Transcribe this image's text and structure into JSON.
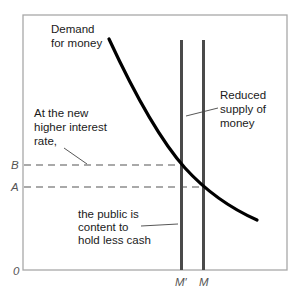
{
  "diagram": {
    "type": "money-market-supply-demand",
    "labels": {
      "demand": [
        "Demand",
        "for money"
      ],
      "higher_rate": [
        "At the new",
        "higher interest",
        "rate,"
      ],
      "reduced_supply": [
        "Reduced",
        "supply of",
        "money"
      ],
      "public": [
        "the public is",
        "content to",
        "hold less cash"
      ]
    },
    "axis": {
      "origin": "0",
      "y_ticks": {
        "B": "B",
        "A": "A"
      },
      "x_ticks": {
        "M_prime": "M′",
        "M": "M"
      }
    },
    "colors": {
      "frame": "#9a9a9a",
      "curve": "#000000",
      "supply_lines": "#4a4a4a",
      "dashed": "#555555",
      "text": "#1a1a1a"
    }
  }
}
